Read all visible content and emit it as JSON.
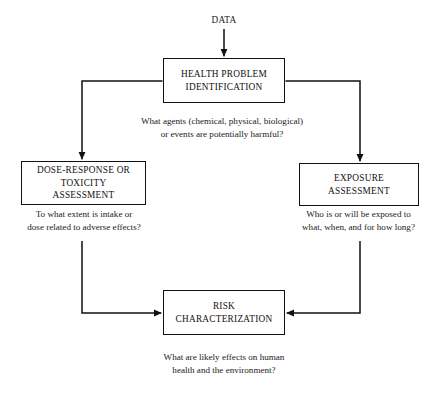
{
  "diagram": {
    "source_label": "DATA",
    "stroke_color": "#111111",
    "background_color": "#ffffff",
    "text_color": "#1a1a1a"
  },
  "nodes": [
    {
      "id": "health-problem-identification",
      "label": "HEALTH PROBLEM\nIDENTIFICATION",
      "caption": "What agents (chemical, physical, biological)\nor events are potentially harmful?"
    },
    {
      "id": "dose-response-or-toxicity-assessment",
      "label": "DOSE-RESPONSE OR\nTOXICITY\nASSESSMENT",
      "caption": "To what extent is intake or\ndose related to adverse effects?"
    },
    {
      "id": "exposure-assessment",
      "label": "EXPOSURE\nASSESSMENT",
      "caption": "Who is or will be exposed to\nwhat, when, and for how long?"
    },
    {
      "id": "risk-characterization",
      "label": "RISK\nCHARACTERIZATION",
      "caption": "What are likely effects on human\nhealth and the environment?"
    }
  ],
  "connectors": [
    {
      "id": "data-to-health",
      "from": "DATA",
      "to": "HEALTH PROBLEM IDENTIFICATION"
    },
    {
      "id": "health-to-dose",
      "from": "HEALTH PROBLEM IDENTIFICATION",
      "to": "DOSE-RESPONSE OR TOXICITY ASSESSMENT"
    },
    {
      "id": "health-to-exposure",
      "from": "HEALTH PROBLEM IDENTIFICATION",
      "to": "EXPOSURE ASSESSMENT"
    },
    {
      "id": "dose-to-risk",
      "from": "DOSE-RESPONSE OR TOXICITY ASSESSMENT",
      "to": "RISK CHARACTERIZATION"
    },
    {
      "id": "exposure-to-risk",
      "from": "EXPOSURE ASSESSMENT",
      "to": "RISK CHARACTERIZATION"
    }
  ]
}
